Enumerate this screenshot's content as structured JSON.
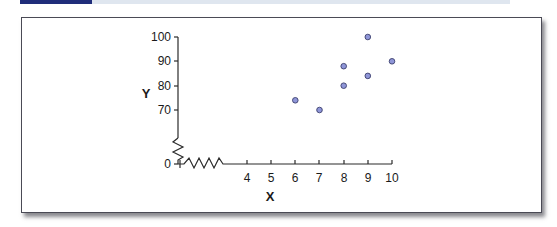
{
  "header": {
    "accent_color": "#1f2d7a",
    "bar_color": "#dfe6ef"
  },
  "chart_data": {
    "type": "scatter",
    "title": "",
    "xlabel": "X",
    "ylabel": "Y",
    "x_ticks": [
      0,
      4,
      5,
      6,
      7,
      8,
      9,
      10
    ],
    "y_ticks": [
      0,
      70,
      80,
      90,
      100
    ],
    "x_axis_break": "between 0 and 4",
    "y_axis_break": "between 0 and 70",
    "xlim": [
      0,
      10
    ],
    "ylim": [
      0,
      100
    ],
    "grid": false,
    "legend": null,
    "point_color": "#8f96d8",
    "points": [
      {
        "x": 6,
        "y": 74
      },
      {
        "x": 7,
        "y": 70
      },
      {
        "x": 8,
        "y": 80
      },
      {
        "x": 8,
        "y": 88
      },
      {
        "x": 9,
        "y": 84
      },
      {
        "x": 9,
        "y": 100
      },
      {
        "x": 10,
        "y": 90
      }
    ]
  },
  "labels": {
    "x_axis_title": "X",
    "y_axis_title": "Y",
    "origin_label": "0",
    "x_tick_labels": [
      "4",
      "5",
      "6",
      "7",
      "8",
      "9",
      "10"
    ],
    "y_tick_labels": [
      "100",
      "90",
      "80",
      "70"
    ]
  }
}
